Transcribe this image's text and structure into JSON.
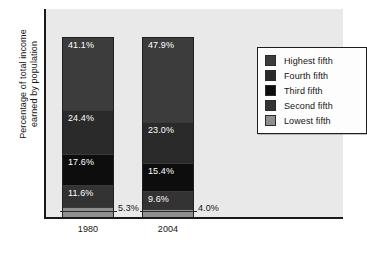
{
  "chart_data": {
    "type": "bar",
    "subtype": "stacked-100-percent",
    "title": "",
    "xlabel": "",
    "ylabel": "Percentage of total income earned by population",
    "ylabel_lines": [
      "Percentage of total income",
      "earned by population"
    ],
    "categories": [
      "1980",
      "2004"
    ],
    "ylim": [
      0,
      100
    ],
    "grid": false,
    "legend_position": "upper right",
    "stack_order_top_to_bottom": [
      "Highest fifth",
      "Fourth fifth",
      "Third fifth",
      "Second fifth",
      "Lowest fifth"
    ],
    "series": [
      {
        "name": "Highest fifth",
        "values": [
          41.1,
          47.9
        ],
        "color": "#3c3c3c"
      },
      {
        "name": "Fourth fifth",
        "values": [
          24.4,
          23.0
        ],
        "color": "#2a2a2a"
      },
      {
        "name": "Third fifth",
        "values": [
          17.6,
          15.4
        ],
        "color": "#0d0d0d"
      },
      {
        "name": "Second fifth",
        "values": [
          11.6,
          9.6
        ],
        "color": "#333333"
      },
      {
        "name": "Lowest fifth",
        "values": [
          5.3,
          4.0
        ],
        "color": "#8f8f8f"
      }
    ],
    "data_labels": {
      "1980": [
        "41.1%",
        "24.4%",
        "17.6%",
        "11.6%",
        "5.3%"
      ],
      "2004": [
        "47.9%",
        "23.0%",
        "15.4%",
        "9.6%",
        "4.0%"
      ]
    },
    "callouts": [
      {
        "category": "1980",
        "series": "Lowest fifth",
        "text": "5.3%"
      },
      {
        "category": "2004",
        "series": "Lowest fifth",
        "text": "4.0%"
      }
    ]
  },
  "axis": {
    "y_title_line1": "Percentage of total income",
    "y_title_line2": "earned by population",
    "x_ticks": [
      "1980",
      "2004"
    ]
  },
  "bars": [
    {
      "category": "1980",
      "segments": [
        {
          "name": "Highest fifth",
          "label": "41.1%",
          "value": 41.1,
          "color": "#3c3c3c"
        },
        {
          "name": "Fourth fifth",
          "label": "24.4%",
          "value": 24.4,
          "color": "#2a2a2a"
        },
        {
          "name": "Third fifth",
          "label": "17.6%",
          "value": 17.6,
          "color": "#0d0d0d"
        },
        {
          "name": "Second fifth",
          "label": "11.6%",
          "value": 11.6,
          "color": "#333333"
        },
        {
          "name": "Lowest fifth",
          "label": "",
          "value": 5.3,
          "color": "#8f8f8f"
        }
      ]
    },
    {
      "category": "2004",
      "segments": [
        {
          "name": "Highest fifth",
          "label": "47.9%",
          "value": 47.9,
          "color": "#3c3c3c"
        },
        {
          "name": "Fourth fifth",
          "label": "23.0%",
          "value": 23.0,
          "color": "#2a2a2a"
        },
        {
          "name": "Third fifth",
          "label": "15.4%",
          "value": 15.4,
          "color": "#0d0d0d"
        },
        {
          "name": "Second fifth",
          "label": "9.6%",
          "value": 9.6,
          "color": "#333333"
        },
        {
          "name": "Lowest fifth",
          "label": "",
          "value": 4.0,
          "color": "#8f8f8f"
        }
      ]
    }
  ],
  "callouts": {
    "bar_1980_lowest": "5.3%",
    "bar_2004_lowest": "4.0%"
  },
  "legend": {
    "items": [
      {
        "label": "Highest fifth",
        "color": "#3c3c3c"
      },
      {
        "label": "Fourth fifth",
        "color": "#2a2a2a"
      },
      {
        "label": "Third fifth",
        "color": "#0d0d0d"
      },
      {
        "label": "Second fifth",
        "color": "#333333"
      },
      {
        "label": "Lowest fifth",
        "color": "#8f8f8f"
      }
    ]
  },
  "colors": {
    "page_background": "#ffffff",
    "plot_background": "#e9e9e9",
    "axis": "#1a1a1a",
    "text": "#141414",
    "label_text": "#ffffff"
  }
}
